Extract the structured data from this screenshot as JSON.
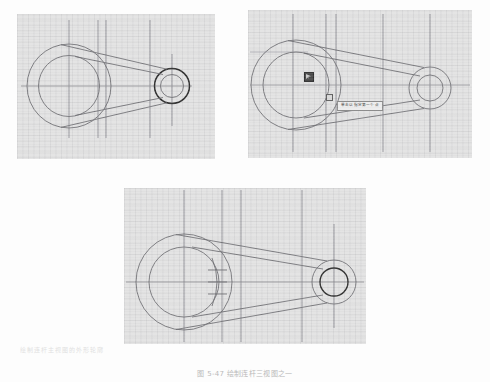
{
  "page": {
    "background_color": "#fdfdfd",
    "panel_background_color": "#e3e3e3",
    "line_color": "#6f6f74",
    "accent_line_color": "#2e2e2e"
  },
  "figure": {
    "caption": "图 5-47  绘制连杆三视图之一",
    "caption_color": "#b9b9b9"
  },
  "panels": [
    {
      "id": "panel-1",
      "name": "step-1-outline",
      "label": "(a)",
      "description": "连杆轮廓线与小端圆已加粗"
    },
    {
      "id": "panel-2",
      "name": "step-2-pick-point",
      "label": "(b)",
      "description": "单击以指定第一个点"
    },
    {
      "id": "panel-3",
      "name": "step-3-detail-marks",
      "label": "(c)",
      "description": "添加细节剖面线与小端圆加粗"
    }
  ],
  "tooltip": {
    "text": "单击以指定第一个点",
    "background_color": "#ececec",
    "border_color": "#8e8e8e",
    "text_color": "#3a3a3a"
  },
  "cursor": {
    "icon": "crosshair-pick-cursor",
    "node_marker": "osnap-square-node"
  },
  "bleed_text": {
    "left": "绘制连杆主视图的外形轮廓",
    "bottom": "图 5-46  绘制连杆三视图"
  }
}
